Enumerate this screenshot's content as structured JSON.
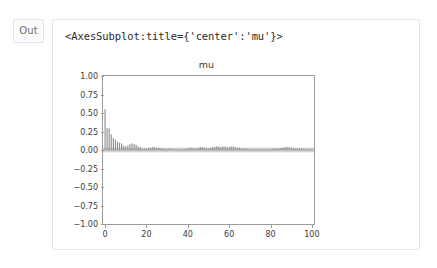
{
  "cell": {
    "prompt_label": "Out",
    "repr_text": "<AxesSubplot:title={'center':'mu'}>"
  },
  "colors": {
    "bar": "#8c8c8c",
    "band": "#b0b0b0",
    "axis": "#9c9c9c",
    "text": "#3c3c3c",
    "cell_border": "#e6e6e6",
    "prompt_border": "#e3e3e3",
    "prompt_bg": "#fbfbfb",
    "background": "#ffffff"
  },
  "chart_data": {
    "type": "bar",
    "title": "mu",
    "xlabel": "",
    "ylabel": "",
    "xlim": [
      -1,
      101
    ],
    "ylim": [
      -1.0,
      1.0
    ],
    "grid": false,
    "legend": null,
    "xticks": [
      0,
      20,
      40,
      60,
      80,
      100
    ],
    "xticklabels": [
      "0",
      "20",
      "40",
      "60",
      "80",
      "100"
    ],
    "yticks": [
      1.0,
      0.75,
      0.5,
      0.25,
      0.0,
      -0.25,
      -0.5,
      -0.75,
      -1.0
    ],
    "yticklabels": [
      "1.00",
      "0.75",
      "0.50",
      "0.25",
      "0.00",
      "−0.25",
      "−0.50",
      "−0.75",
      "−1.00"
    ],
    "confidence_band": {
      "upper": 0.032,
      "lower": -0.032
    },
    "x": [
      0,
      1,
      2,
      3,
      4,
      5,
      6,
      7,
      8,
      9,
      10,
      11,
      12,
      13,
      14,
      15,
      16,
      17,
      18,
      19,
      20,
      21,
      22,
      23,
      24,
      25,
      26,
      27,
      28,
      29,
      30,
      31,
      32,
      33,
      34,
      35,
      36,
      37,
      38,
      39,
      40,
      41,
      42,
      43,
      44,
      45,
      46,
      47,
      48,
      49,
      50,
      51,
      52,
      53,
      54,
      55,
      56,
      57,
      58,
      59,
      60,
      61,
      62,
      63,
      64,
      65,
      66,
      67,
      68,
      69,
      70,
      71,
      72,
      73,
      74,
      75,
      76,
      77,
      78,
      79,
      80,
      81,
      82,
      83,
      84,
      85,
      86,
      87,
      88,
      89,
      90,
      91,
      92,
      93,
      94,
      95,
      96,
      97,
      98,
      99,
      100
    ],
    "values": [
      0.55,
      0.3,
      0.29,
      0.21,
      0.16,
      0.14,
      0.11,
      0.1,
      0.09,
      0.06,
      0.05,
      0.06,
      0.08,
      0.09,
      0.08,
      0.07,
      0.05,
      0.04,
      0.02,
      0.02,
      0.02,
      0.03,
      0.03,
      0.04,
      0.04,
      0.03,
      0.03,
      0.02,
      0.02,
      0.01,
      0.01,
      0.02,
      0.02,
      0.01,
      0.01,
      0.01,
      0.0,
      0.01,
      0.01,
      0.02,
      0.02,
      0.03,
      0.03,
      0.02,
      0.02,
      0.03,
      0.04,
      0.04,
      0.03,
      0.03,
      0.02,
      0.03,
      0.04,
      0.04,
      0.05,
      0.05,
      0.04,
      0.05,
      0.05,
      0.04,
      0.04,
      0.05,
      0.05,
      0.04,
      0.03,
      0.03,
      0.02,
      0.02,
      0.02,
      0.01,
      0.01,
      0.01,
      0.0,
      0.01,
      0.0,
      0.01,
      0.01,
      0.0,
      0.01,
      0.01,
      0.01,
      0.02,
      0.02,
      0.02,
      0.02,
      0.03,
      0.03,
      0.04,
      0.04,
      0.04,
      0.03,
      0.03,
      0.02,
      0.02,
      0.02,
      0.02,
      0.01,
      0.01,
      0.01,
      0.01,
      0.01
    ]
  }
}
